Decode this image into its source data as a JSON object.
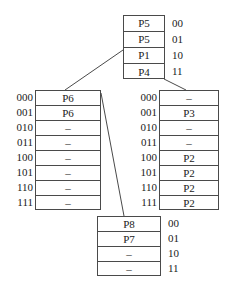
{
  "diagram": {
    "type": "extendible-hashing-directory",
    "root_directory": {
      "entries": [
        {
          "key": "00",
          "value": "P5"
        },
        {
          "key": "01",
          "value": "P5"
        },
        {
          "key": "10",
          "value": "P1"
        },
        {
          "key": "11",
          "value": "P4"
        }
      ]
    },
    "left_directory": {
      "entries": [
        {
          "key": "000",
          "value": "P6"
        },
        {
          "key": "001",
          "value": "P6"
        },
        {
          "key": "010",
          "value": "–"
        },
        {
          "key": "011",
          "value": "–"
        },
        {
          "key": "100",
          "value": "–"
        },
        {
          "key": "101",
          "value": "–"
        },
        {
          "key": "110",
          "value": "–"
        },
        {
          "key": "111",
          "value": "–"
        }
      ]
    },
    "right_directory": {
      "entries": [
        {
          "key": "000",
          "value": "–"
        },
        {
          "key": "001",
          "value": "P3"
        },
        {
          "key": "010",
          "value": "–"
        },
        {
          "key": "011",
          "value": "–"
        },
        {
          "key": "100",
          "value": "P2"
        },
        {
          "key": "101",
          "value": "P2"
        },
        {
          "key": "110",
          "value": "P2"
        },
        {
          "key": "111",
          "value": "P2"
        }
      ]
    },
    "bottom_directory": {
      "entries": [
        {
          "key": "00",
          "value": "P8"
        },
        {
          "key": "01",
          "value": "P7"
        },
        {
          "key": "10",
          "value": "–"
        },
        {
          "key": "11",
          "value": "–"
        }
      ]
    },
    "edges": [
      {
        "from": "root_directory.10",
        "to": "left_directory"
      },
      {
        "from": "root_directory.11",
        "to": "right_directory"
      },
      {
        "from": "left_directory.000",
        "to": "bottom_directory"
      }
    ],
    "colors": {
      "line": "#4a4a4a",
      "text": "#1a1a1a",
      "background": "#ffffff"
    }
  }
}
